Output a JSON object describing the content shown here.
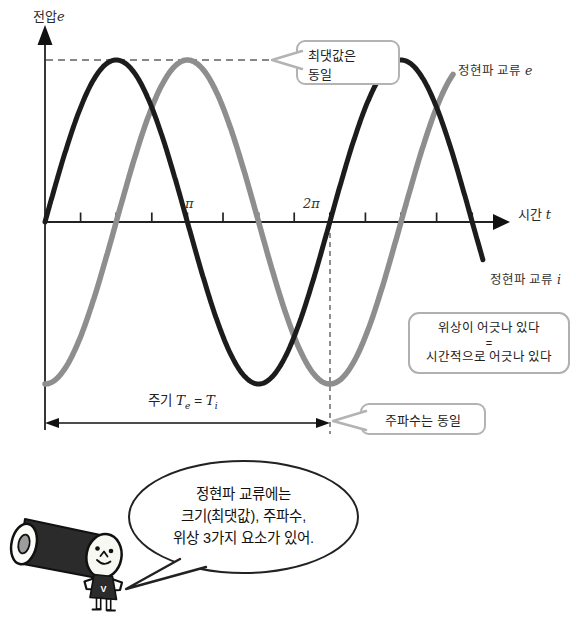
{
  "chart": {
    "y_axis_label": {
      "text": "전압",
      "symbol": "e"
    },
    "x_axis_label": {
      "text": "시간",
      "symbol": "t"
    },
    "ticks": {
      "pi": "π",
      "two_pi": "2π"
    },
    "curve_labels": {
      "e": {
        "text": "정현파 교류",
        "symbol": "e"
      },
      "i": {
        "text": "정현파 교류",
        "symbol": "i"
      }
    },
    "callouts": {
      "max": {
        "line1": "최댓값은",
        "line2": "동일"
      },
      "frequency": "주파수는 동일"
    },
    "phase_note": {
      "line1": "위상이 어긋나 있다",
      "line2": "=",
      "line3": "시간적으로 어긋나 있다"
    },
    "period": {
      "label": "주기",
      "t": "T",
      "sub_e": "e",
      "equals": "=",
      "sub_i": "i"
    }
  },
  "speech_bubble": {
    "line1": "정현파 교류에는",
    "line2": "크기(최댓값), 주파수,",
    "line3": "위상 3가지 요소가 있어."
  },
  "mascot": {
    "shirt_letter": "V"
  },
  "chart_data": {
    "type": "line",
    "title": "",
    "xlabel": "시간 t",
    "ylabel": "전압 e",
    "x_axis_unit": "radians",
    "x_tick_labels": [
      "π",
      "2π"
    ],
    "grid": false,
    "layout": {
      "x0_px": 45,
      "y0_px": 222,
      "px_per_radian": 45.33,
      "amplitude_px": 162,
      "tick_interval_rad": 0.7854,
      "tick_count": 12
    },
    "series": [
      {
        "name": "정현파 교류 e",
        "expression": "sin(t − π/2)",
        "phase_rad": -1.5708,
        "t_start_rad": 0,
        "t_end_rad": 9.0,
        "color": "#8e8e8e",
        "stroke_px": 5.5,
        "data_name": "sine-curve-e"
      },
      {
        "name": "정현파 교류 i",
        "expression": "sin(t)",
        "phase_rad": 0,
        "t_start_rad": 0,
        "t_end_rad": 9.67,
        "color": "#1f1f1f",
        "stroke_px": 5,
        "data_name": "sine-curve-i"
      }
    ],
    "annotations": [
      "최댓값은 동일",
      "주파수는 동일",
      "위상이 어긋나 있다 = 시간적으로 어긋나 있다",
      "주기 Te = Ti"
    ]
  }
}
